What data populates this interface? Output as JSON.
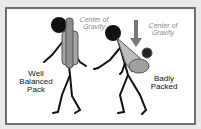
{
  "figure": {
    "left_label": {
      "line1": "Well",
      "line2": "Balanced",
      "line3": "Pack"
    },
    "right_label": {
      "line1": "Badly",
      "line2": "Packed"
    },
    "left_cog": {
      "line1": "Center of",
      "line2": "Gravity"
    },
    "right_cog": {
      "line1": "Center of",
      "line2": "Gravity"
    }
  },
  "colors": {
    "frame": "#6e6e6e",
    "pack": "#9a9a9a",
    "arrow": "#777777",
    "figure": "#111111"
  }
}
